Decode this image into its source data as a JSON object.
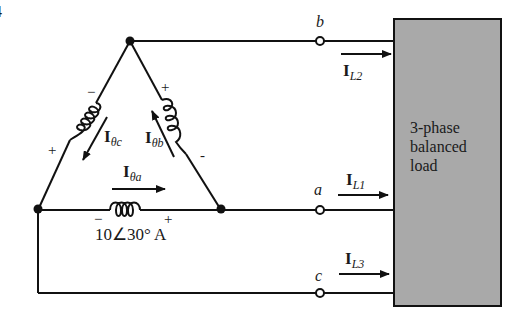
{
  "figure": {
    "number_fragment": "4",
    "load": {
      "line1": "3-phase",
      "line2": "balanced",
      "line3": "load",
      "fill_color": "#a9a9a9"
    },
    "terminals": {
      "b": "b",
      "a": "a",
      "c": "c"
    },
    "line_currents": {
      "IL2": {
        "main": "I",
        "sub": "L2"
      },
      "IL1": {
        "main": "I",
        "sub": "L1"
      },
      "IL3": {
        "main": "I",
        "sub": "L3"
      }
    },
    "phase_currents": {
      "Ia": {
        "main": "I",
        "sub": "θa"
      },
      "Ib": {
        "main": "I",
        "sub": "θb"
      },
      "Ic": {
        "main": "I",
        "sub": "θc"
      }
    },
    "source_a_value": "10∠30° A",
    "polarity": {
      "a_minus": "−",
      "a_plus": "+",
      "b_plus": "+",
      "b_minus": "-",
      "c_minus": "−",
      "c_plus": "+"
    }
  }
}
